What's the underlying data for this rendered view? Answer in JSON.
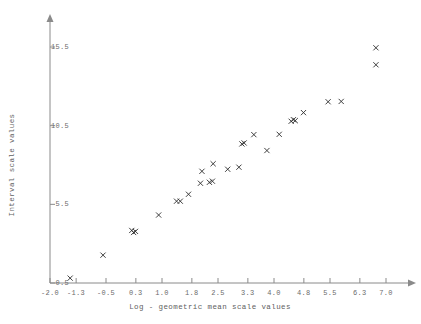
{
  "chart_data": {
    "type": "scatter",
    "title": "",
    "xlabel": "Log - geometric mean scale values",
    "ylabel": "Interval scale values",
    "xlim": [
      -2.0,
      7.4
    ],
    "ylim": [
      0.0,
      16.6
    ],
    "xticks": [
      -2.0,
      -1.3,
      -0.5,
      0.3,
      1.0,
      1.8,
      2.5,
      3.3,
      4.0,
      4.8,
      5.5,
      6.3,
      7.0
    ],
    "xtick_labels": [
      "-2.0",
      "-1.3",
      "-0.5",
      "0.3",
      "1.0",
      "1.8",
      "2.5",
      "3.3",
      "4.0",
      "4.8",
      "5.5",
      "6.3",
      "7.0"
    ],
    "yticks": [
      0.5,
      5.5,
      10.5,
      15.5
    ],
    "ytick_labels": [
      "0.5",
      "5.5",
      "10.5",
      "15.5"
    ],
    "grid": false,
    "legend": null,
    "marker": "x",
    "marker_color": "#2b2b2b",
    "points": [
      {
        "x": -1.46,
        "y": 0.81
      },
      {
        "x": -0.58,
        "y": 2.27
      },
      {
        "x": 0.19,
        "y": 3.84
      },
      {
        "x": 0.24,
        "y": 3.71
      },
      {
        "x": 0.29,
        "y": 3.78
      },
      {
        "x": 0.91,
        "y": 4.82
      },
      {
        "x": 1.39,
        "y": 5.7
      },
      {
        "x": 1.49,
        "y": 5.7
      },
      {
        "x": 1.71,
        "y": 6.14
      },
      {
        "x": 2.03,
        "y": 6.84
      },
      {
        "x": 2.27,
        "y": 6.9
      },
      {
        "x": 2.35,
        "y": 6.97
      },
      {
        "x": 2.07,
        "y": 7.6
      },
      {
        "x": 2.37,
        "y": 8.08
      },
      {
        "x": 2.76,
        "y": 7.73
      },
      {
        "x": 3.06,
        "y": 7.86
      },
      {
        "x": 3.14,
        "y": 9.34
      },
      {
        "x": 3.2,
        "y": 9.4
      },
      {
        "x": 3.46,
        "y": 9.93
      },
      {
        "x": 3.81,
        "y": 8.92
      },
      {
        "x": 4.14,
        "y": 9.95
      },
      {
        "x": 4.46,
        "y": 10.78
      },
      {
        "x": 4.52,
        "y": 10.88
      },
      {
        "x": 4.57,
        "y": 10.82
      },
      {
        "x": 4.79,
        "y": 11.33
      },
      {
        "x": 5.45,
        "y": 12.02
      },
      {
        "x": 5.8,
        "y": 12.04
      },
      {
        "x": 6.73,
        "y": 14.37
      },
      {
        "x": 6.73,
        "y": 15.45
      }
    ]
  }
}
